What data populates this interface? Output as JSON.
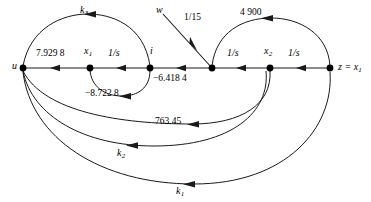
{
  "figure": {
    "type": "signal-flow-graph",
    "width": 371,
    "height": 202,
    "line_color": "#1a1a1a",
    "text_color": "#000000",
    "background": "#ffffff"
  },
  "nodes": [
    {
      "id": "u",
      "label": "u",
      "sub": "",
      "x": 23,
      "y": 68,
      "label_dx": -11,
      "label_dy": -5
    },
    {
      "id": "x1",
      "label": "x",
      "sub": "1",
      "x": 90,
      "y": 68,
      "label_dx": -4,
      "label_dy": -20
    },
    {
      "id": "i",
      "label": "i",
      "sub": "",
      "x": 150,
      "y": 68,
      "label_dx": 1,
      "label_dy": -20
    },
    {
      "id": "n4",
      "label": "",
      "sub": "",
      "x": 212,
      "y": 68,
      "label_dx": 0,
      "label_dy": 0
    },
    {
      "id": "x2",
      "label": "x",
      "sub": "2",
      "x": 270,
      "y": 68,
      "label_dx": -4,
      "label_dy": -20
    },
    {
      "id": "z",
      "label": "z",
      "sub": "",
      "x": 330,
      "y": 68,
      "label_dx": 8,
      "label_dy": -5
    }
  ],
  "source_label": {
    "text": "w",
    "x": 158,
    "y": 8
  },
  "output_label": {
    "text": "z = x",
    "sub": "1",
    "x": 338,
    "y": 62
  },
  "edge_labels": [
    {
      "name": "gain-u-x1",
      "text": "7.929 8",
      "x": 36,
      "y": 53,
      "style": "num"
    },
    {
      "name": "gain-x1-i",
      "text": "1/s",
      "x": 108,
      "y": 52,
      "style": "gain"
    },
    {
      "name": "gain-i-n4",
      "text": "−6.418 4",
      "x": 157,
      "y": 76,
      "style": "num"
    },
    {
      "name": "gain-n4-x2",
      "text": "1/s",
      "x": 228,
      "y": 52,
      "style": "gain"
    },
    {
      "name": "gain-x2-z",
      "text": "1/s",
      "x": 288,
      "y": 52,
      "style": "gain"
    },
    {
      "name": "gain-w-i",
      "text": "1/15",
      "x": 185,
      "y": 13,
      "style": "num"
    },
    {
      "name": "gain-k3",
      "text": "k",
      "sub": "3",
      "x": 80,
      "y": 7,
      "style": "k"
    },
    {
      "name": "gain-x1-loop",
      "text": "−8.722 8",
      "x": 87,
      "y": 89,
      "style": "num"
    },
    {
      "name": "gain-4900",
      "text": "4 900",
      "x": 240,
      "y": 9,
      "style": "num"
    },
    {
      "name": "gain-763",
      "text": "763.45",
      "x": 157,
      "y": 117,
      "style": "num"
    },
    {
      "name": "gain-k2",
      "text": "k",
      "sub": "2",
      "x": 116,
      "y": 136,
      "style": "k"
    },
    {
      "name": "gain-k1",
      "text": "k",
      "sub": "1",
      "x": 175,
      "y": 174,
      "style": "k"
    }
  ],
  "edges": [
    {
      "name": "edge-u-to-x1",
      "from": "u",
      "to": "x1",
      "gain": "7.929 8",
      "direction": "forward"
    },
    {
      "name": "edge-x1-to-i",
      "from": "x1",
      "to": "i",
      "gain": "1/s",
      "direction": "forward"
    },
    {
      "name": "edge-i-to-n4",
      "from": "i",
      "to": "n4",
      "gain": "−6.418 4",
      "direction": "forward"
    },
    {
      "name": "edge-n4-to-x2",
      "from": "n4",
      "to": "x2",
      "gain": "1/s",
      "direction": "forward"
    },
    {
      "name": "edge-x2-to-z",
      "from": "x2",
      "to": "z",
      "gain": "1/s",
      "direction": "forward"
    },
    {
      "name": "edge-w-to-n4",
      "from": "w",
      "to": "n4",
      "gain": "1/15",
      "direction": "forward"
    },
    {
      "name": "edge-k3-feedback",
      "from": "i",
      "to": "u",
      "gain": "k3",
      "direction": "backward"
    },
    {
      "name": "edge-x1-self-loop",
      "from": "i",
      "to": "x1",
      "gain": "−8.722 8",
      "direction": "backward"
    },
    {
      "name": "edge-4900-feedback",
      "from": "z",
      "to": "n4",
      "gain": "4 900",
      "direction": "backward"
    },
    {
      "name": "edge-763-feedback",
      "from": "x2",
      "to": "u",
      "gain": "763.45",
      "direction": "backward"
    },
    {
      "name": "edge-k2-feedback",
      "from": "x2",
      "to": "u",
      "gain": "k2",
      "direction": "backward"
    },
    {
      "name": "edge-k1-feedback",
      "from": "z",
      "to": "u",
      "gain": "k1",
      "direction": "backward"
    }
  ]
}
